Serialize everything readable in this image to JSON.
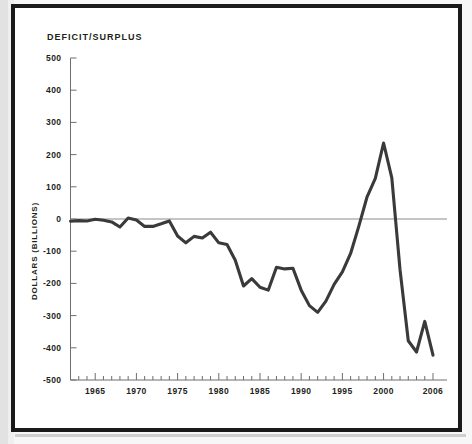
{
  "figure": {
    "title": "DEFICIT/SURPLUS",
    "y_axis_title": "DOLLARS (BILLIONS)",
    "line_color": "#3a3a3a",
    "axis_color": "#6e6e6e",
    "zero_line_color": "#8a8a8a",
    "frame_color": "#1a1a1a",
    "background_color": "#ffffff"
  },
  "chart_data": {
    "type": "line",
    "title": "DEFICIT/SURPLUS",
    "xlabel": "",
    "ylabel": "DOLLARS (BILLIONS)",
    "xlim": [
      1962,
      2006
    ],
    "ylim": [
      -500,
      500
    ],
    "grid": false,
    "legend": "none",
    "y_ticks": [
      500,
      400,
      300,
      200,
      100,
      0,
      -100,
      -200,
      -300,
      -400,
      -500
    ],
    "y_tick_labels": [
      "500",
      "400",
      "300",
      "200",
      "100",
      "0",
      "-100",
      "-200",
      "-300",
      "-400",
      "-500"
    ],
    "x_ticks": [
      1965,
      1970,
      1975,
      1980,
      1985,
      1990,
      1995,
      2000,
      2006
    ],
    "x_tick_labels": [
      "1965",
      "1970",
      "1975",
      "1980",
      "1985",
      "1990",
      "1995",
      "2000",
      "2006"
    ],
    "x_minor_tick_step": 1,
    "zero_reference_line": 0,
    "series": [
      {
        "name": "Federal deficit/surplus",
        "x": [
          1962,
          1963,
          1964,
          1965,
          1966,
          1967,
          1968,
          1969,
          1970,
          1971,
          1972,
          1973,
          1974,
          1975,
          1976,
          1977,
          1978,
          1979,
          1980,
          1981,
          1982,
          1983,
          1984,
          1985,
          1986,
          1987,
          1988,
          1989,
          1990,
          1991,
          1992,
          1993,
          1994,
          1995,
          1996,
          1997,
          1998,
          1999,
          2000,
          2001,
          2002,
          2003,
          2004,
          2005,
          2006
        ],
        "values": [
          -7,
          -5,
          -6,
          -1,
          -4,
          -9,
          -25,
          3,
          -3,
          -23,
          -23,
          -15,
          -6,
          -53,
          -74,
          -54,
          -59,
          -41,
          -74,
          -79,
          -128,
          -208,
          -185,
          -212,
          -221,
          -150,
          -155,
          -153,
          -221,
          -269,
          -290,
          -255,
          -203,
          -164,
          -107,
          -22,
          69,
          126,
          236,
          128,
          -158,
          -378,
          -413,
          -318,
          -423
        ]
      }
    ]
  }
}
